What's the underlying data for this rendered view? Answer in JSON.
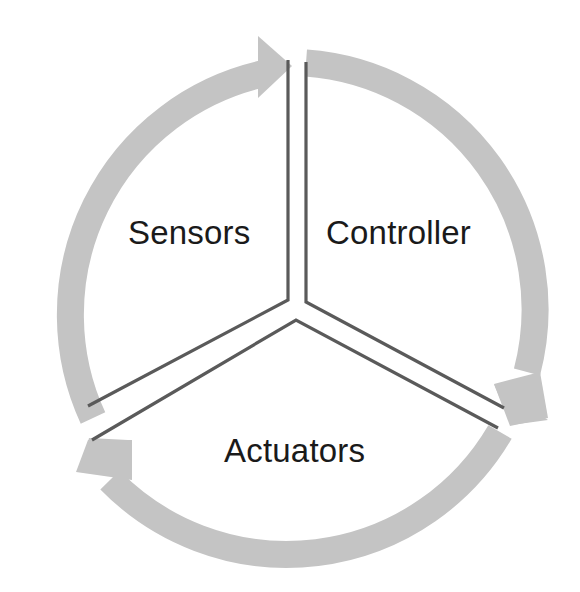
{
  "diagram": {
    "type": "cycle",
    "title": "",
    "segments": [
      {
        "id": "sensors",
        "label": "Sensors"
      },
      {
        "id": "controller",
        "label": "Controller"
      },
      {
        "id": "actuators",
        "label": "Actuators"
      }
    ],
    "flow": [
      "Sensors",
      "Controller",
      "Actuators",
      "Sensors"
    ],
    "colors": {
      "arrow": "#c4c4c4",
      "divider": "#5a5a5a",
      "text": "#1a1a1a",
      "background": "#ffffff"
    }
  }
}
